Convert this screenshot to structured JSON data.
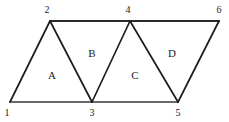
{
  "figure": {
    "kind": "triangle-strip-diagram",
    "width": 229,
    "height": 122,
    "background_color": "#ffffff",
    "line_color": "#1c1c1c",
    "label_color": "#1a1a1a"
  },
  "vertices": [
    {
      "id": "v1",
      "label": "1",
      "x": 10,
      "y": 102,
      "label_x": 7,
      "label_y": 113
    },
    {
      "id": "v2",
      "label": "2",
      "x": 50,
      "y": 21,
      "label_x": 47,
      "label_y": 10
    },
    {
      "id": "v3",
      "label": "3",
      "x": 92,
      "y": 102,
      "label_x": 92,
      "label_y": 113
    },
    {
      "id": "v4",
      "label": "4",
      "x": 130,
      "y": 21,
      "label_x": 128,
      "label_y": 10
    },
    {
      "id": "v5",
      "label": "5",
      "x": 178,
      "y": 102,
      "label_x": 178,
      "label_y": 113
    },
    {
      "id": "v6",
      "label": "6",
      "x": 219,
      "y": 21,
      "label_x": 219,
      "label_y": 10
    }
  ],
  "edges": [
    {
      "id": "e-top",
      "from": "v2",
      "to": "v6",
      "style": "top",
      "d": "M 50 21 L 219 21"
    },
    {
      "id": "e-bottom",
      "from": "v1",
      "to": "v5",
      "style": "bottom",
      "d": "M 10 102 L 178 102"
    },
    {
      "id": "e-1-2",
      "from": "v1",
      "to": "v2",
      "style": "slant",
      "d": "M 10 102 L 50 21"
    },
    {
      "id": "e-2-3",
      "from": "v2",
      "to": "v3",
      "style": "slant",
      "d": "M 50 21 L 92 102"
    },
    {
      "id": "e-3-4",
      "from": "v3",
      "to": "v4",
      "style": "slant",
      "d": "M 92 102 L 130 21"
    },
    {
      "id": "e-4-5",
      "from": "v4",
      "to": "v5",
      "style": "slant",
      "d": "M 130 21 L 178 102"
    },
    {
      "id": "e-5-6",
      "from": "v5",
      "to": "v6",
      "style": "slant",
      "d": "M 178 102 L 219 21"
    }
  ],
  "regions": [
    {
      "id": "rA",
      "label": "A",
      "vertices": "1-2-3",
      "x": 52,
      "y": 75
    },
    {
      "id": "rB",
      "label": "B",
      "vertices": "2-3-4",
      "x": 92,
      "y": 53
    },
    {
      "id": "rC",
      "label": "C",
      "vertices": "3-4-5",
      "x": 135,
      "y": 75
    },
    {
      "id": "rD",
      "label": "D",
      "vertices": "4-5-6",
      "x": 172,
      "y": 53
    }
  ]
}
